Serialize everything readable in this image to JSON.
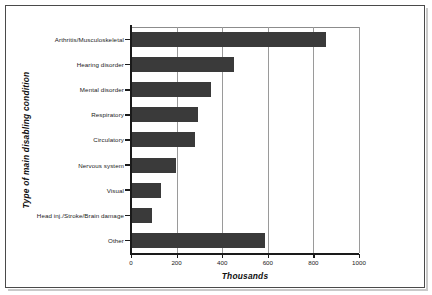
{
  "chart_data": {
    "type": "bar",
    "orientation": "horizontal",
    "title": "",
    "xlabel": "Thousands",
    "ylabel": "Type of main disabling condition",
    "categories": [
      "Arthritis/Musculoskeletal",
      "Hearing disorder",
      "Mental disorder",
      "Respiratory",
      "Circulatory",
      "Nervous system",
      "Visual",
      "Head inj./Stroke/Brain damage",
      "Other"
    ],
    "values": [
      855,
      452,
      351,
      294,
      281,
      197,
      132,
      92,
      588
    ],
    "xlim": [
      0,
      1000
    ],
    "xticks": [
      0,
      200,
      400,
      600,
      800,
      1000
    ],
    "xtick_labels": [
      "0",
      "200",
      "400",
      "600",
      "800",
      "1000"
    ],
    "grid": "vertical",
    "legend": "none",
    "bar_color": "#3a3a3a",
    "grid_color": "#9a9a9a",
    "axis_color": "#1a1a1a",
    "background_color": "#ffffff",
    "frame_color": "#4a4a4a"
  }
}
